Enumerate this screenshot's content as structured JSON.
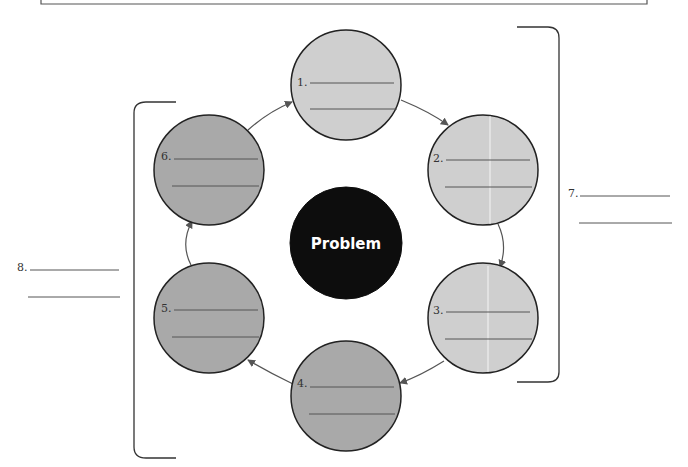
{
  "diagram": {
    "center": {
      "label": "Problem",
      "fill": "#0d0d0d"
    },
    "colors": {
      "light_circle": "#cfcfcf",
      "dark_circle": "#a9a9a9",
      "outline": "#222222",
      "arrow": "#555555",
      "line": "#555555"
    },
    "nodes": [
      {
        "number": "1.",
        "shade": "light"
      },
      {
        "number": "2.",
        "shade": "light"
      },
      {
        "number": "3.",
        "shade": "light"
      },
      {
        "number": "4.",
        "shade": "dark"
      },
      {
        "number": "5.",
        "shade": "dark"
      },
      {
        "number": "6.",
        "shade": "dark"
      }
    ],
    "brackets": [
      {
        "number": "7.",
        "groups": [
          "1",
          "2",
          "3"
        ],
        "side": "right"
      },
      {
        "number": "8.",
        "groups": [
          "4",
          "5",
          "6"
        ],
        "side": "left"
      }
    ]
  }
}
